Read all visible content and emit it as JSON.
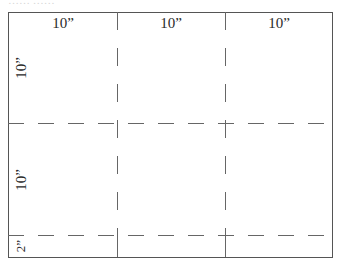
{
  "diagram": {
    "type": "cutting-layout",
    "top_cutoff_text": "…… ……",
    "colors": {
      "border": "#555555",
      "dashed": "#666666",
      "text": "#2a2a2a"
    },
    "columns": [
      {
        "label": "10”"
      },
      {
        "label": "10”"
      },
      {
        "label": "10”"
      }
    ],
    "rows": [
      {
        "label": "10”"
      },
      {
        "label": "10”"
      },
      {
        "label": "2”"
      }
    ]
  }
}
